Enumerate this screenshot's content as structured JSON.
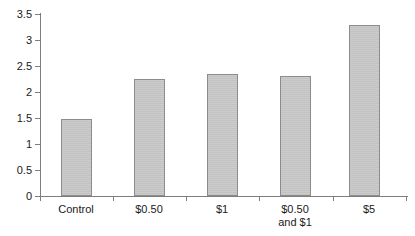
{
  "chart_data": {
    "type": "bar",
    "title": "",
    "subtitle": "",
    "xlabel": "",
    "ylabel": "",
    "categories": [
      "Control",
      "$0.50",
      "$1",
      "$0.50\nand $1",
      "$5"
    ],
    "values": [
      1.48,
      2.25,
      2.34,
      2.3,
      3.28
    ],
    "ylim": [
      0,
      3.5
    ],
    "yticks": [
      "0",
      "0.5",
      "1",
      "1.5",
      "2",
      "2.5",
      "3",
      "3.5"
    ],
    "ytick_values": [
      0,
      0.5,
      1,
      1.5,
      2,
      2.5,
      3,
      3.5
    ],
    "grid": false,
    "legend": false,
    "legend_position": "none",
    "bar_color": "#c6c6c6",
    "bar_border_color": "#8c8c8c",
    "axis_color": "#7d7d7d",
    "text_color": "#1a1a1a",
    "background": "#ffffff"
  }
}
